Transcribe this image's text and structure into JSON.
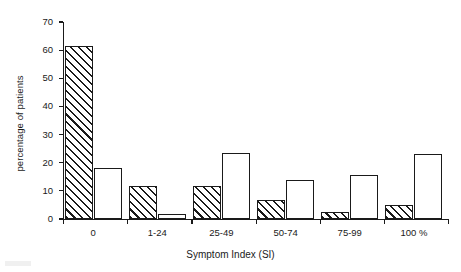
{
  "chart_data": {
    "type": "bar",
    "title": "",
    "subtitle": "",
    "xlabel": "Symptom Index (SI)",
    "ylabel": "percentage of patients",
    "categories": [
      "0",
      "1-24",
      "25-49",
      "50-74",
      "75-99",
      "100 %"
    ],
    "series": [
      {
        "name": "hatched",
        "fill": "diagonal-hatch",
        "values": [
          61.4,
          11.6,
          11.6,
          6.7,
          2.5,
          4.9
        ]
      },
      {
        "name": "open",
        "fill": "open-white",
        "values": [
          18.2,
          1.8,
          23.5,
          13.8,
          15.5,
          23.0
        ]
      }
    ],
    "ylim": [
      0,
      70
    ],
    "yticks": [
      0,
      10,
      20,
      30,
      40,
      50,
      60,
      70
    ],
    "ytick_labels": [
      "0",
      "10",
      "20",
      "30",
      "40",
      "50",
      "60",
      "70"
    ],
    "grid": false,
    "legend": "none",
    "annotations": []
  },
  "colors": {
    "ink": "#1a1a1a",
    "background": "#ffffff"
  }
}
